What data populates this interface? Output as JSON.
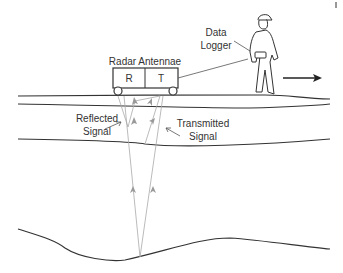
{
  "diagram": {
    "type": "ground-penetrating-radar-schematic",
    "labels": {
      "data_logger_line1": "Data",
      "data_logger_line2": "Logger",
      "radar_antennae": "Radar Antennae",
      "receiver": "R",
      "transmitter": "T",
      "reflected_line1": "Reflected",
      "reflected_line2": "Signal",
      "transmitted_line1": "Transmitted",
      "transmitted_line2": "Signal"
    },
    "icons": {
      "direction": "arrow-right",
      "operator": "person-walking"
    },
    "colors": {
      "line": "#333333",
      "signal": "#aaaaaa"
    }
  }
}
